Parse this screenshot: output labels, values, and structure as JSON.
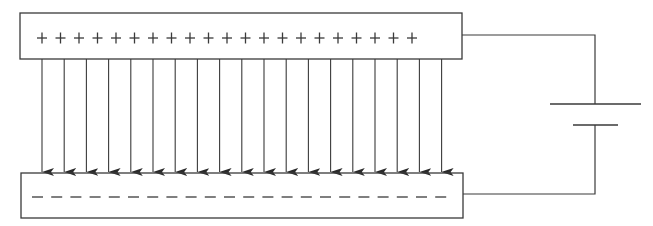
{
  "diagram": {
    "colors": {
      "line": "#3a3a3a",
      "background": "#ffffff"
    },
    "top_plate": {
      "label": "positive plate",
      "x": 20,
      "y": 13,
      "width": 442,
      "height": 46,
      "charge_symbol": "+",
      "charge_count": 21,
      "charge_start_x": 42,
      "charge_spacing": 18.5,
      "charge_y": 38
    },
    "bottom_plate": {
      "label": "negative plate",
      "x": 21,
      "y": 173,
      "width": 442,
      "height": 45,
      "charge_symbol": "−",
      "charge_count": 22,
      "charge_start_x": 32,
      "charge_spacing": 19.2,
      "charge_y": 197,
      "dash_length": 11
    },
    "field_lines": {
      "label": "electric field",
      "count": 19,
      "start_x": 42,
      "spacing": 22.2,
      "y_start": 59,
      "y_end": 172,
      "direction": "down"
    },
    "battery": {
      "label": "battery",
      "long_plate": {
        "x1": 550,
        "x2": 641,
        "y": 104
      },
      "short_plate": {
        "x1": 573,
        "x2": 618,
        "y": 125
      },
      "terminal_x": 595
    },
    "wires": {
      "top": {
        "from_x": 462,
        "y": 35,
        "to_x": 595
      },
      "bottom": {
        "from_x": 463,
        "y": 194,
        "to_x": 595
      }
    }
  }
}
